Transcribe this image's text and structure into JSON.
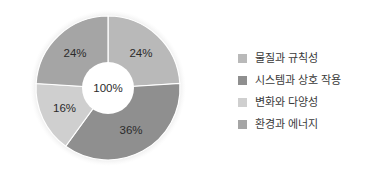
{
  "chart_data": {
    "type": "pie",
    "title": "",
    "subtitle": "",
    "variant": "donut",
    "center_label": "100%",
    "legend_position": "right",
    "grid": false,
    "categories": [
      "물질과 규칙성",
      "시스템과 상호 작용",
      "변화와 다양성",
      "환경과 에너지"
    ],
    "values": [
      24,
      36,
      16,
      24
    ],
    "value_labels": [
      "24%",
      "36%",
      "16%",
      "24%"
    ],
    "colors": [
      "#b9b9b9",
      "#8f8f8f",
      "#cfcfcf",
      "#a5a5a5"
    ],
    "slices": [
      {
        "label": "물질과 규칙성",
        "value": 24,
        "value_label": "24%",
        "color": "#b9b9b9",
        "start_angle": 0,
        "end_angle": 86.4
      },
      {
        "label": "시스템과 상호 작용",
        "value": 36,
        "value_label": "36%",
        "color": "#8f8f8f",
        "start_angle": 86.4,
        "end_angle": 216
      },
      {
        "label": "변화와 다양성",
        "value": 16,
        "value_label": "16%",
        "color": "#cfcfcf",
        "start_angle": 216,
        "end_angle": 273.6
      },
      {
        "label": "환경과 에너지",
        "value": 24,
        "value_label": "24%",
        "color": "#a5a5a5",
        "start_angle": 273.6,
        "end_angle": 360
      }
    ],
    "xlabel": "",
    "ylabel": ""
  },
  "legend": {
    "items": [
      {
        "label": "물질과 규칙성",
        "color": "#b9b9b9"
      },
      {
        "label": "시스템과 상호 작용",
        "color": "#8f8f8f"
      },
      {
        "label": "변화와 다양성",
        "color": "#cfcfcf"
      },
      {
        "label": "환경과 에너지",
        "color": "#a5a5a5"
      }
    ]
  }
}
